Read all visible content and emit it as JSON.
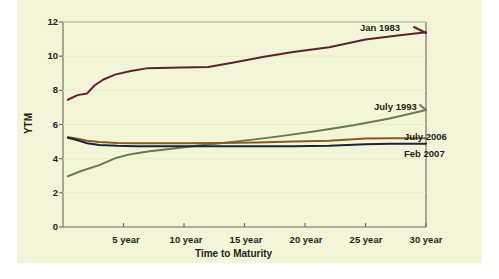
{
  "chart_data": {
    "type": "line",
    "title": "",
    "xlabel": "Time to Maturity",
    "ylabel": "YTM",
    "xlim": [
      0,
      30
    ],
    "ylim": [
      0,
      12
    ],
    "grid": false,
    "legend_position": "inline-annotations",
    "yticks": [
      "12",
      "10",
      "8",
      "6",
      "4",
      "2",
      "0"
    ],
    "ytick_values": [
      12,
      10,
      8,
      6,
      4,
      2,
      0
    ],
    "xticks": [
      "5 year",
      "10 year",
      "15 year",
      "20 year",
      "25 year",
      "30 year"
    ],
    "xtick_values": [
      5,
      10,
      15,
      20,
      25,
      30
    ],
    "series": [
      {
        "name": "Jan 1983",
        "color": "#5c2233",
        "x": [
          0.4,
          1.2,
          2.0,
          2.6,
          3.3,
          4.3,
          5.5,
          7.0,
          9.8,
          12.0,
          14.0,
          16.5,
          19.0,
          22.0,
          25.0,
          27.5,
          30.0
        ],
        "values": [
          7.45,
          7.72,
          7.82,
          8.28,
          8.62,
          8.92,
          9.12,
          9.3,
          9.33,
          9.37,
          9.62,
          9.95,
          10.25,
          10.52,
          10.98,
          11.2,
          11.4
        ]
      },
      {
        "name": "July 1993",
        "color": "#6d7a4e",
        "x": [
          0.4,
          1.5,
          3.0,
          4.3,
          5.5,
          7.0,
          9.0,
          11.0,
          13.0,
          15.5,
          18.0,
          21.0,
          24.0,
          27.0,
          30.0
        ],
        "values": [
          2.97,
          3.28,
          3.62,
          4.02,
          4.25,
          4.42,
          4.58,
          4.75,
          4.9,
          5.1,
          5.32,
          5.62,
          5.95,
          6.35,
          6.85
        ]
      },
      {
        "name": "July 2006",
        "color": "#8a5a24",
        "x": [
          0.4,
          1.0,
          2.0,
          3.0,
          4.5,
          6.0,
          8.0,
          10.0,
          13.0,
          16.0,
          19.0,
          22.0,
          25.0,
          27.0,
          30.0
        ],
        "values": [
          5.25,
          5.2,
          5.05,
          4.97,
          4.92,
          4.9,
          4.9,
          4.9,
          4.92,
          4.95,
          5.0,
          5.05,
          5.18,
          5.2,
          5.2
        ]
      },
      {
        "name": "Feb 2007",
        "color": "#1c2142",
        "x": [
          0.4,
          1.0,
          2.0,
          3.0,
          4.5,
          6.0,
          8.0,
          10.0,
          13.0,
          16.0,
          19.0,
          22.0,
          25.0,
          27.0,
          30.0
        ],
        "values": [
          5.22,
          5.12,
          4.9,
          4.8,
          4.75,
          4.73,
          4.72,
          4.72,
          4.72,
          4.72,
          4.73,
          4.75,
          4.85,
          4.88,
          4.88
        ]
      }
    ],
    "annotations": [
      {
        "text": "Jan 1983",
        "x_px": 360,
        "y_px": 22
      },
      {
        "text": "July 1993",
        "x_px": 374,
        "y_px": 101
      },
      {
        "text": "July 2006",
        "x_px": 404,
        "y_px": 131
      },
      {
        "text": "Feb 2007",
        "x_px": 404,
        "y_px": 148
      }
    ],
    "colors": {
      "background": "#f4f4d8",
      "axis": "#6b6b5a",
      "text": "#231f20"
    }
  }
}
